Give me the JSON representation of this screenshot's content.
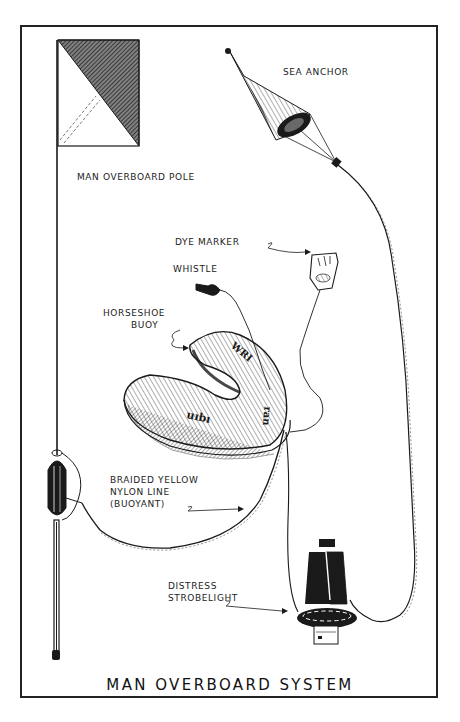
{
  "diagram": {
    "title": "MAN OVERBOARD SYSTEM",
    "style": "pen-and-ink illustration",
    "colors": {
      "ink": "#1a1a1a",
      "paper": "#ffffff"
    },
    "labels": {
      "sea_anchor": "SEA ANCHOR",
      "pole": "MAN OVERBOARD POLE",
      "dye_marker": "DYE MARKER",
      "whistle": "WHISTLE",
      "horseshoe_line1": "HORSESHOE",
      "horseshoe_line2": "BUOY",
      "line_line1": "BRAIDED YELLOW",
      "line_line2": "NYLON LINE",
      "line_line3": "(BUOYANT)",
      "strobe_line1": "DISTRESS",
      "strobe_line2": "STROBELIGHT"
    },
    "components": [
      "man-overboard-pole",
      "flag",
      "pole-float",
      "sea-anchor",
      "dye-marker",
      "whistle",
      "horseshoe-buoy",
      "braided-nylon-line",
      "distress-strobelight"
    ]
  }
}
